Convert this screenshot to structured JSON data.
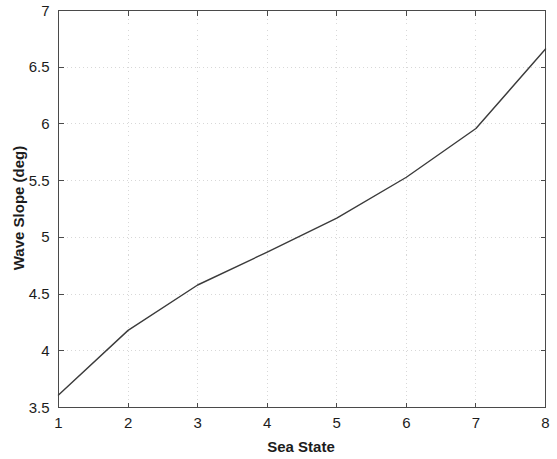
{
  "chart_data": {
    "type": "line",
    "title": "",
    "xlabel": "Sea State",
    "ylabel": "Wave Slope (deg)",
    "x": [
      1,
      2,
      3,
      4,
      5,
      6,
      7,
      8
    ],
    "values": [
      3.61,
      4.18,
      4.58,
      4.87,
      5.17,
      5.53,
      5.96,
      6.66
    ],
    "series": [
      {
        "name": "Wave Slope",
        "values": [
          3.61,
          4.18,
          4.58,
          4.87,
          5.17,
          5.53,
          5.96,
          6.66
        ]
      }
    ],
    "xlim": [
      1,
      8
    ],
    "ylim": [
      3.5,
      7
    ],
    "xticks": [
      1,
      2,
      3,
      4,
      5,
      6,
      7,
      8
    ],
    "yticks": [
      3.5,
      4,
      4.5,
      5,
      5.5,
      6,
      6.5,
      7
    ],
    "xticklabels": [
      "1",
      "2",
      "3",
      "4",
      "5",
      "6",
      "7",
      "8"
    ],
    "yticklabels": [
      "3.5",
      "4",
      "4.5",
      "5",
      "5.5",
      "6",
      "6.5",
      "7"
    ],
    "grid": true,
    "grid_style": "dotted",
    "legend": null,
    "line_color": "#3b3b3b",
    "background_color": "#ffffff",
    "axis_color": "#4a4a4a",
    "grid_color": "#d8d8d8"
  }
}
